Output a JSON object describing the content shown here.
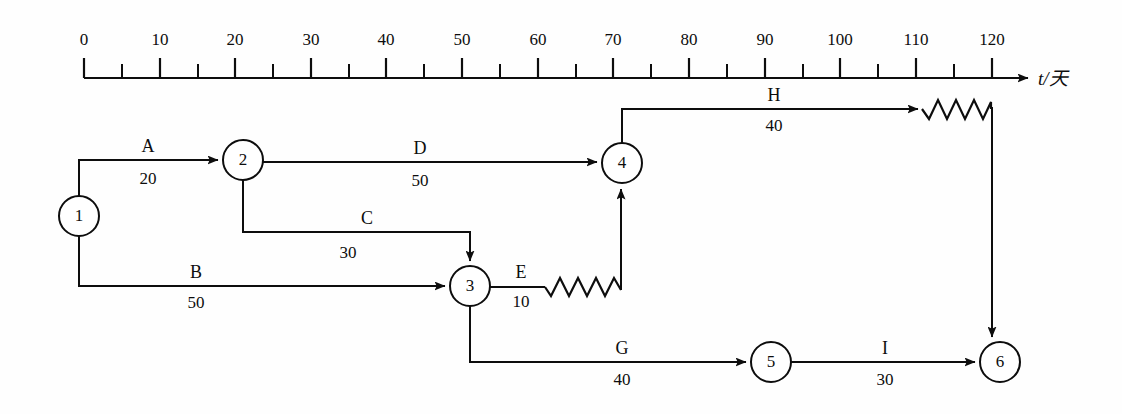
{
  "figure": {
    "kind": "time-scaled-network-diagram",
    "axis": {
      "label": "t/天",
      "min": 0,
      "max": 120,
      "major_step": 10,
      "minor_step": 5,
      "tick_labels": [
        "0",
        "10",
        "20",
        "30",
        "40",
        "50",
        "60",
        "70",
        "80",
        "90",
        "100",
        "110",
        "120"
      ],
      "tick_values": [
        0,
        10,
        20,
        30,
        40,
        50,
        60,
        70,
        80,
        90,
        100,
        110,
        120
      ]
    },
    "nodes": [
      {
        "id": "1",
        "label": "1",
        "x": 79,
        "y": 216,
        "r": 20
      },
      {
        "id": "2",
        "label": "2",
        "x": 243,
        "y": 160,
        "r": 20
      },
      {
        "id": "3",
        "label": "3",
        "x": 470,
        "y": 286,
        "r": 20
      },
      {
        "id": "4",
        "label": "4",
        "x": 622,
        "y": 163,
        "r": 20
      },
      {
        "id": "5",
        "label": "5",
        "x": 771,
        "y": 362,
        "r": 20
      },
      {
        "id": "6",
        "label": "6",
        "x": 1000,
        "y": 362,
        "r": 20
      }
    ],
    "activities": [
      {
        "id": "A",
        "name": "A",
        "duration": "20",
        "from": "1",
        "to": "2",
        "float": "0",
        "name_x": 148,
        "name_y": 152,
        "dur_x": 148,
        "dur_y": 182
      },
      {
        "id": "B",
        "name": "B",
        "duration": "50",
        "from": "1",
        "to": "3",
        "float": "0",
        "name_x": 196,
        "name_y": 278,
        "dur_x": 196,
        "dur_y": 306
      },
      {
        "id": "C",
        "name": "C",
        "duration": "30",
        "from": "2",
        "to": "3",
        "float": "0",
        "name_x": 367,
        "name_y": 224,
        "dur_x": 348,
        "dur_y": 256
      },
      {
        "id": "D",
        "name": "D",
        "duration": "50",
        "from": "2",
        "to": "4",
        "float": "0",
        "name_x": 420,
        "name_y": 155,
        "dur_x": 420,
        "dur_y": 185
      },
      {
        "id": "E",
        "name": "E",
        "duration": "10",
        "from": "3",
        "to": "4",
        "float": "10",
        "name_x": 521,
        "name_y": 278,
        "dur_x": 521,
        "dur_y": 305
      },
      {
        "id": "G",
        "name": "G",
        "duration": "40",
        "from": "3",
        "to": "5",
        "float": "0",
        "name_x": 622,
        "name_y": 355,
        "dur_x": 622,
        "dur_y": 383
      },
      {
        "id": "H",
        "name": "H",
        "duration": "40",
        "from": "4",
        "to": "6",
        "float": "10",
        "name_x": 774,
        "name_y": 99,
        "dur_x": 774,
        "dur_y": 128
      },
      {
        "id": "I",
        "name": "I",
        "duration": "30",
        "from": "5",
        "to": "6",
        "float": "0",
        "name_x": 885,
        "name_y": 355,
        "dur_x": 885,
        "dur_y": 383
      }
    ]
  }
}
